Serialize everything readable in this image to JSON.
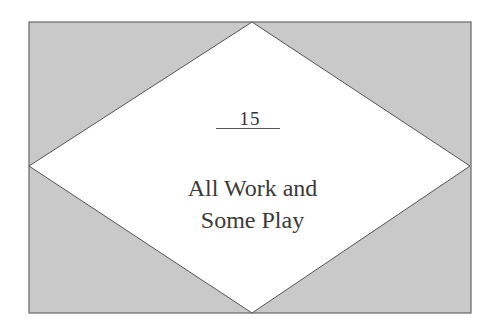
{
  "chapter": {
    "number": "15",
    "title_line1": "All Work and",
    "title_line2": "Some Play"
  },
  "colors": {
    "background": "#ffffff",
    "panel_fill": "#c9c9c9",
    "diamond_fill": "#ffffff",
    "stroke": "#555555",
    "text": "#3a3a3a"
  }
}
